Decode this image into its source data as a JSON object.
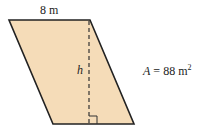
{
  "figure": {
    "shape": "parallelogram",
    "fill_color": "#f5dcb8",
    "stroke_color": "#222222",
    "top_side_label": "8 m",
    "height_label": "h",
    "area_label": {
      "variable": "A",
      "equals": "=",
      "value": "88",
      "unit": "m",
      "exponent": "2"
    }
  }
}
